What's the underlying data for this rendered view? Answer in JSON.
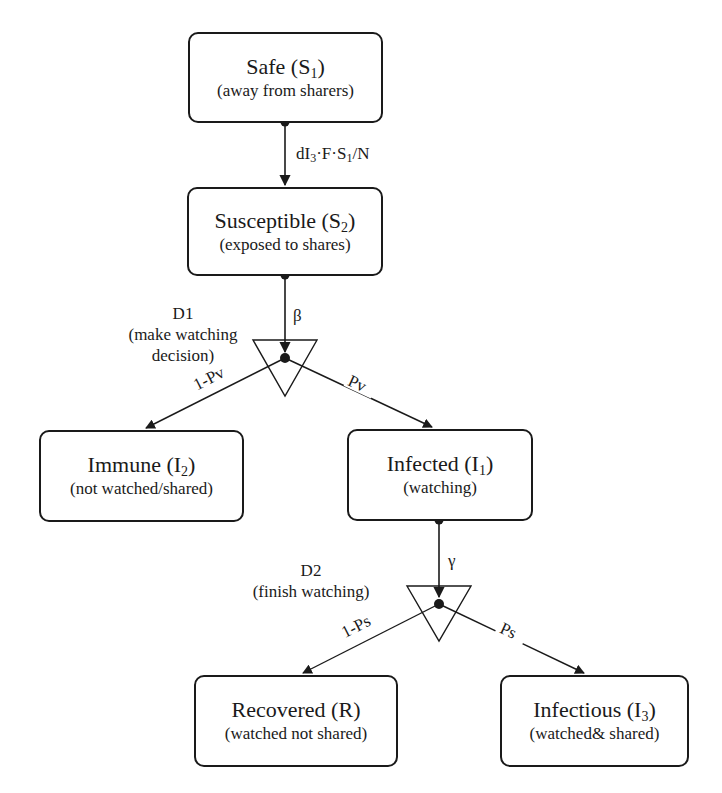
{
  "diagram": {
    "type": "state-transition flowchart",
    "nodes": {
      "safe": {
        "name": "Safe",
        "symbol": "S",
        "subscript": "1",
        "description": "(away from sharers)"
      },
      "susceptible": {
        "name": "Susceptible",
        "symbol": "S",
        "subscript": "2",
        "description": "(exposed to shares)"
      },
      "immune": {
        "name": "Immune",
        "symbol": "I",
        "subscript": "2",
        "description": "(not watched/shared)"
      },
      "infected": {
        "name": "Infected",
        "symbol": "I",
        "subscript": "1",
        "description": "(watching)"
      },
      "recovered": {
        "name": "Recovered",
        "symbol": "R",
        "subscript": "",
        "description": "(watched not shared)"
      },
      "infectious": {
        "name": "Infectious",
        "symbol": "I",
        "subscript": "3",
        "description": "(watched& shared)"
      }
    },
    "decisions": {
      "d1": {
        "id": "D1",
        "description_line1": "(make watching",
        "description_line2": "decision)"
      },
      "d2": {
        "id": "D2",
        "description": "(finish watching)"
      }
    },
    "edges": {
      "safe_to_susceptible": {
        "from": "Safe",
        "to": "Susceptible",
        "label_parts": [
          "dI",
          "3",
          "·F·S",
          "1",
          "/N"
        ]
      },
      "susceptible_to_d1": {
        "from": "Susceptible",
        "to": "D1",
        "label": "β"
      },
      "d1_to_immune": {
        "from": "D1",
        "to": "Immune",
        "label": "1-Pv"
      },
      "d1_to_infected": {
        "from": "D1",
        "to": "Infected",
        "label": "Pv"
      },
      "infected_to_d2": {
        "from": "Infected",
        "to": "D2",
        "label": "γ"
      },
      "d2_to_recovered": {
        "from": "D2",
        "to": "Recovered",
        "label": "1-Ps"
      },
      "d2_to_infectious": {
        "from": "D2",
        "to": "Infectious",
        "label": "Ps"
      }
    }
  }
}
